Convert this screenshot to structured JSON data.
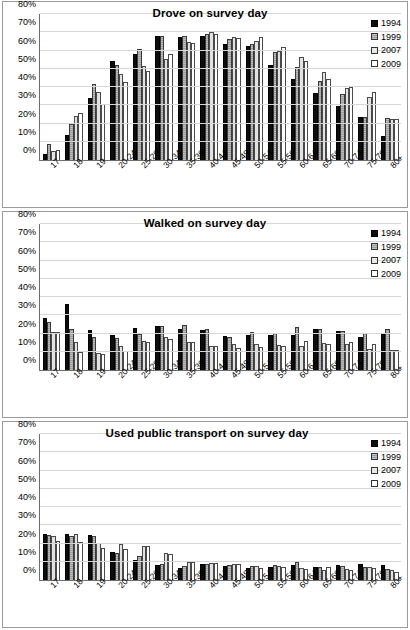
{
  "figure": {
    "series_names": [
      "1994",
      "1999",
      "2007",
      "2009"
    ],
    "categories": [
      "17",
      "18",
      "19",
      "20-24",
      "25-29",
      "30-34",
      "35-39",
      "40-44",
      "45-49",
      "50-54",
      "55-59",
      "60-64",
      "65-69",
      "70-74",
      "75-79",
      "80+"
    ],
    "y_ticks": [
      "0%",
      "10%",
      "20%",
      "30%",
      "40%",
      "50%",
      "60%",
      "70%",
      "80%"
    ],
    "colors": {
      "s1994": "#0d0d0d",
      "s1999": "#9b9b9b",
      "s2007": "#e2e2e2",
      "s2009": "#ffffff",
      "gridline": "#d6d6d6",
      "axis": "#6d6d6d",
      "panel_border": "#9a9a9a"
    }
  },
  "chart_data": [
    {
      "type": "bar",
      "title": "Drove on survey day",
      "xlabel": "",
      "ylabel": "",
      "ylim": [
        0,
        80
      ],
      "yticks": [
        0,
        10,
        20,
        30,
        40,
        50,
        60,
        70,
        80
      ],
      "grid": true,
      "legend_position": "top-right",
      "categories": [
        "17",
        "18",
        "19",
        "20-24",
        "25-29",
        "30-34",
        "35-39",
        "40-44",
        "45-49",
        "50-54",
        "55-59",
        "60-64",
        "65-69",
        "70-74",
        "75-79",
        "80+"
      ],
      "series": [
        {
          "name": "1994",
          "values": [
            3.5,
            13.5,
            34.2,
            54.0,
            58.3,
            68.0,
            67.4,
            67.8,
            63.8,
            62.6,
            51.8,
            44.4,
            36.8,
            29.5,
            23.4,
            13.0
          ]
        },
        {
          "name": "1999",
          "values": [
            9.0,
            20.0,
            41.4,
            52.0,
            60.8,
            68.2,
            67.8,
            69.3,
            66.1,
            63.6,
            59.3,
            50.7,
            43.2,
            36.3,
            23.5,
            22.8
          ]
        },
        {
          "name": "2007",
          "values": [
            5.0,
            24.1,
            37.1,
            47.0,
            51.4,
            55.6,
            64.5,
            70.3,
            67.6,
            65.2,
            59.8,
            56.2,
            48.4,
            39.6,
            34.5,
            22.4
          ]
        },
        {
          "name": "2009",
          "values": [
            5.4,
            25.8,
            30.6,
            43.0,
            48.6,
            58.2,
            64.0,
            68.9,
            67.1,
            67.2,
            62.0,
            54.3,
            44.3,
            39.9,
            37.1,
            22.3
          ]
        }
      ]
    },
    {
      "type": "bar",
      "title": "Walked on survey day",
      "xlabel": "",
      "ylabel": "",
      "ylim": [
        0,
        80
      ],
      "yticks": [
        0,
        10,
        20,
        30,
        40,
        50,
        60,
        70,
        80
      ],
      "grid": true,
      "legend_position": "top-right",
      "categories": [
        "17",
        "18",
        "19",
        "20-24",
        "25-29",
        "30-34",
        "35-39",
        "40-44",
        "45-49",
        "50-54",
        "55-59",
        "60-64",
        "65-69",
        "70-74",
        "75-79",
        "80+"
      ],
      "series": [
        {
          "name": "1994",
          "values": [
            28.7,
            36.2,
            22.0,
            19.1,
            22.9,
            24.3,
            22.3,
            22.2,
            18.4,
            19.3,
            19.0,
            19.0,
            22.4,
            21.4,
            18.3,
            19.5
          ]
        },
        {
          "name": "1999",
          "values": [
            26.5,
            22.7,
            18.3,
            17.6,
            19.7,
            24.1,
            24.4,
            22.7,
            17.9,
            21.0,
            20.5,
            23.4,
            22.4,
            21.6,
            20.4,
            22.4
          ]
        },
        {
          "name": "2007",
          "values": [
            20.6,
            15.3,
            9.3,
            12.9,
            16.0,
            18.0,
            15.4,
            13.0,
            14.0,
            14.1,
            13.8,
            13.4,
            14.8,
            14.5,
            11.3,
            11.2
          ]
        },
        {
          "name": "2009",
          "values": [
            20.6,
            10.1,
            9.0,
            10.3,
            15.3,
            17.0,
            15.4,
            13.4,
            11.9,
            12.4,
            13.4,
            15.7,
            14.5,
            15.1,
            14.4,
            10.9
          ]
        }
      ]
    },
    {
      "type": "bar",
      "title": "Used public transport on survey day",
      "xlabel": "",
      "ylabel": "",
      "ylim": [
        0,
        80
      ],
      "yticks": [
        0,
        10,
        20,
        30,
        40,
        50,
        60,
        70,
        80
      ],
      "grid": true,
      "legend_position": "top-right",
      "categories": [
        "17",
        "18",
        "19",
        "20-24",
        "25-29",
        "30-34",
        "35-39",
        "40-44",
        "45-49",
        "50-54",
        "55-59",
        "60-64",
        "65-69",
        "70-74",
        "75-79",
        "80+"
      ],
      "series": [
        {
          "name": "1994",
          "values": [
            25.2,
            25.1,
            24.9,
            15.1,
            11.0,
            8.0,
            6.7,
            8.8,
            7.5,
            6.8,
            6.9,
            8.5,
            7.4,
            8.1,
            8.7,
            8.2
          ]
        },
        {
          "name": "1999",
          "values": [
            24.5,
            23.9,
            24.3,
            14.9,
            13.1,
            8.9,
            7.7,
            8.8,
            8.4,
            7.5,
            8.5,
            9.9,
            7.1,
            7.6,
            7.3,
            6.0
          ]
        },
        {
          "name": "2007",
          "values": [
            24.2,
            25.2,
            20.3,
            19.8,
            18.7,
            14.7,
            9.7,
            9.2,
            8.8,
            7.9,
            7.5,
            6.7,
            5.6,
            6.2,
            7.0,
            5.4
          ]
        },
        {
          "name": "2009",
          "values": [
            21.6,
            21.0,
            17.6,
            17.1,
            18.5,
            14.3,
            10.0,
            9.4,
            8.7,
            6.4,
            7.3,
            6.3,
            7.1,
            5.7,
            6.7,
            4.2
          ]
        }
      ]
    }
  ]
}
